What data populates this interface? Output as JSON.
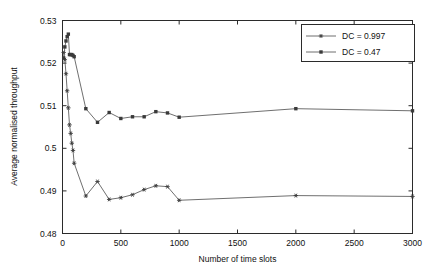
{
  "chart_data": {
    "type": "line",
    "title": "",
    "xlabel": "Number of time slots",
    "ylabel": "Average normalised throughput",
    "xlim": [
      0,
      3000
    ],
    "ylim": [
      0.48,
      0.53
    ],
    "grid": false,
    "legend_position": "top-right",
    "xticks": [
      0,
      500,
      1000,
      1500,
      2000,
      2500,
      3000
    ],
    "xtick_labels": [
      "0",
      "500",
      "1000",
      "1500",
      "2000",
      "2500",
      "3000"
    ],
    "yticks": [
      0.48,
      0.49,
      0.5,
      0.51,
      0.52,
      0.53
    ],
    "ytick_labels": [
      "0.48",
      "0.49",
      "0.5",
      "0.51",
      "0.52",
      "0.53"
    ],
    "series": [
      {
        "name": "DC = 0.997",
        "marker": "star",
        "x": [
          10,
          20,
          30,
          40,
          50,
          60,
          70,
          80,
          90,
          100,
          200,
          300,
          400,
          500,
          600,
          700,
          800,
          900,
          1000,
          2000,
          3000
        ],
        "y": [
          0.5225,
          0.5208,
          0.5175,
          0.5135,
          0.5095,
          0.5055,
          0.5035,
          0.5012,
          0.4995,
          0.4965,
          0.4888,
          0.4922,
          0.488,
          0.4884,
          0.4891,
          0.4903,
          0.4912,
          0.491,
          0.4878,
          0.4889,
          0.4887
        ]
      },
      {
        "name": "DC = 0.47",
        "marker": "square",
        "x": [
          10,
          20,
          30,
          40,
          50,
          60,
          70,
          80,
          90,
          100,
          200,
          300,
          400,
          500,
          600,
          700,
          800,
          900,
          1000,
          2000,
          3000
        ],
        "y": [
          0.5212,
          0.5238,
          0.5252,
          0.5262,
          0.5268,
          0.522,
          0.522,
          0.522,
          0.5218,
          0.5215,
          0.5093,
          0.5061,
          0.5084,
          0.507,
          0.5074,
          0.5074,
          0.5086,
          0.5083,
          0.5073,
          0.5093,
          0.5088
        ]
      }
    ]
  },
  "colors": {
    "axis": "#2b2b2b",
    "series_line": "#4a4a4a",
    "marker": "#3a3a3a",
    "background": "#ffffff"
  }
}
